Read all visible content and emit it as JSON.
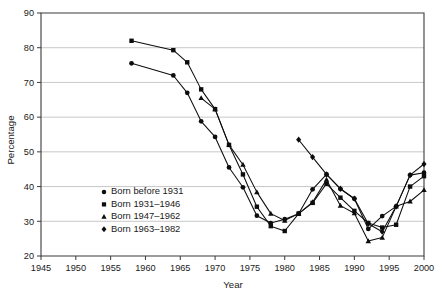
{
  "chart_data": {
    "type": "line",
    "title": "",
    "xlabel": "Year",
    "ylabel": "Percentage",
    "xlim": [
      1945,
      2000
    ],
    "ylim": [
      20,
      90
    ],
    "xticks": [
      1945,
      1950,
      1955,
      1960,
      1965,
      1970,
      1975,
      1980,
      1985,
      1990,
      1995,
      2000
    ],
    "yticks": [
      20,
      30,
      40,
      50,
      60,
      70,
      80,
      90
    ],
    "grid": "horizontal",
    "legend_position": "inside-lower-left",
    "series": [
      {
        "name": "Born before 1931",
        "marker": "circle",
        "x": [
          1958,
          1964,
          1966,
          1968,
          1970,
          1972,
          1974,
          1976,
          1978,
          1980,
          1982,
          1984,
          1986,
          1988,
          1990,
          1992,
          1994,
          1996,
          1998,
          2000
        ],
        "values": [
          75.5,
          72.0,
          67.0,
          58.8,
          54.3,
          45.5,
          39.8,
          31.6,
          29.5,
          30.6,
          32.2,
          39.2,
          43.5,
          39.3,
          36.5,
          27.8,
          31.5,
          34.3,
          43.3,
          44.0
        ]
      },
      {
        "name": "Born 1931–1946",
        "marker": "square",
        "x": [
          1958,
          1964,
          1966,
          1968,
          1970,
          1972,
          1974,
          1976,
          1978,
          1980,
          1982,
          1984,
          1986,
          1988,
          1990,
          1992,
          1994,
          1996,
          1998,
          2000
        ],
        "values": [
          82.0,
          79.3,
          75.8,
          68.0,
          62.3,
          52.0,
          43.5,
          34.2,
          28.6,
          27.2,
          32.2,
          35.3,
          40.8,
          36.8,
          33.0,
          29.5,
          28.2,
          29.0,
          40.0,
          43.0
        ]
      },
      {
        "name": "Born 1947–1962",
        "marker": "triangle",
        "x": [
          1968,
          1970,
          1972,
          1974,
          1976,
          1978,
          1980,
          1982,
          1984,
          1986,
          1988,
          1990,
          1992,
          1994,
          1996,
          1998,
          2000
        ],
        "values": [
          65.5,
          62.3,
          52.0,
          46.3,
          38.4,
          32.2,
          30.2,
          32.2,
          35.5,
          42.0,
          34.5,
          32.3,
          24.3,
          25.3,
          34.3,
          35.7,
          39.0
        ]
      },
      {
        "name": "Born 1963–1982",
        "marker": "diamond",
        "x": [
          1982,
          1984,
          1986,
          1988,
          1990,
          1992,
          1994,
          1996,
          1998,
          2000
        ],
        "values": [
          53.5,
          48.5,
          43.5,
          39.4,
          36.5,
          29.3,
          27.0,
          34.3,
          43.3,
          46.5
        ]
      }
    ]
  },
  "axis": {
    "y_label": "Percentage",
    "x_label": "Year",
    "y_tick_labels": [
      "20",
      "30",
      "40",
      "50",
      "60",
      "70",
      "80",
      "90"
    ],
    "x_tick_labels": [
      "1945",
      "1950",
      "1955",
      "1960",
      "1965",
      "1970",
      "1975",
      "1980",
      "1985",
      "1990",
      "1995",
      "2000"
    ]
  },
  "legend": {
    "items": [
      {
        "label": "Born before 1931",
        "marker": "circle"
      },
      {
        "label": "Born 1931–1946",
        "marker": "square"
      },
      {
        "label": "Born 1947–1962",
        "marker": "triangle"
      },
      {
        "label": "Born 1963–1982",
        "marker": "diamond"
      }
    ]
  },
  "colors": {
    "ink": "#0d0d0d",
    "axis": "#3b3b3b",
    "grid": "#b9b9b9",
    "background": "#ffffff"
  }
}
